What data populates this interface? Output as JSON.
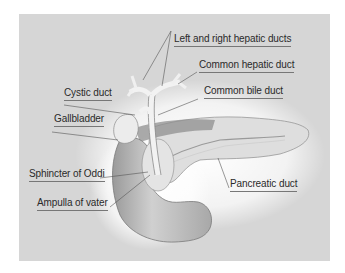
{
  "diagram": {
    "title": "",
    "background_color": "#d6d6d6",
    "labels": [
      {
        "id": "left-right-hepatic-ducts",
        "text": "Left and right hepatic ducts"
      },
      {
        "id": "common-hepatic-duct",
        "text": "Common hepatic duct"
      },
      {
        "id": "cystic-duct",
        "text": "Cystic duct"
      },
      {
        "id": "common-bile-duct",
        "text": "Common bile duct"
      },
      {
        "id": "gallbladder",
        "text": "Gallbladder"
      },
      {
        "id": "sphincter-of-oddi",
        "text": "Sphincter of Oddi"
      },
      {
        "id": "pancreatic-duct",
        "text": "Pancreatic duct"
      },
      {
        "id": "ampulla-of-vater",
        "text": "Ampulla of vater"
      }
    ]
  }
}
